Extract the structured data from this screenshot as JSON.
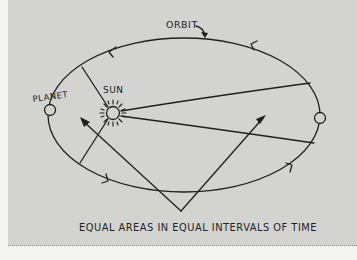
{
  "figure": {
    "labels": {
      "orbit": "ORBIT",
      "planet": "PLANET",
      "sun": "SUN"
    },
    "caption": "EQUAL AREAS IN EQUAL INTERVALS OF TIME"
  },
  "colors": {
    "background": "#d3d3d1",
    "page": "#f4f4f2",
    "ink": "#1f1f1f"
  }
}
